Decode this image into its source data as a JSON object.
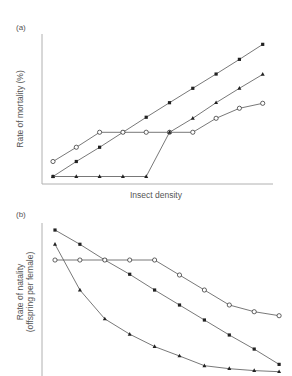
{
  "chart_data": [
    {
      "panel": "(a)",
      "type": "line",
      "title": "",
      "xlabel": "Insect density",
      "ylabel": "Rate of mortality (%)",
      "x": [
        1,
        2,
        3,
        4,
        5,
        6,
        7,
        8,
        9,
        10
      ],
      "ylim": [
        0,
        100
      ],
      "grid": false,
      "legend": null,
      "tick_labels": false,
      "series": [
        {
          "name": "filled-circle",
          "marker": "filled-circle",
          "values": [
            5,
            15,
            24.5,
            34.5,
            44.5,
            54.2,
            63.8,
            73.3,
            83.1,
            93.1
          ]
        },
        {
          "name": "open-circle",
          "marker": "open-circle",
          "values": [
            15,
            24.5,
            34.5,
            34.5,
            34.5,
            34.5,
            34.5,
            43.8,
            50.5,
            53.8
          ]
        },
        {
          "name": "filled-triangle",
          "marker": "filled-triangle",
          "values": [
            5,
            5,
            5,
            5,
            5,
            34.5,
            43.8,
            54.2,
            63.8,
            73.1
          ]
        }
      ]
    },
    {
      "panel": "(b)",
      "type": "line",
      "title": "",
      "xlabel": "",
      "ylabel": "Rate of natality (offspring per female)",
      "ylabel_lines": [
        "Rate of natality",
        "(offspring per female)"
      ],
      "x": [
        1,
        2,
        3,
        4,
        5,
        6,
        7,
        8,
        9,
        10
      ],
      "ylim": [
        0,
        100
      ],
      "grid": false,
      "legend": null,
      "tick_labels": false,
      "series": [
        {
          "name": "filled-circle",
          "marker": "filled-circle",
          "values": [
            95.4,
            86.1,
            75.8,
            66.5,
            56.2,
            46.4,
            36.6,
            26.8,
            17.6,
            7.6
          ]
        },
        {
          "name": "open-circle",
          "marker": "open-circle",
          "values": [
            75.8,
            75.8,
            75.8,
            75.8,
            75.8,
            66,
            56.2,
            46.4,
            42,
            39.4
          ]
        },
        {
          "name": "filled-triangle",
          "marker": "filled-triangle",
          "values": [
            86.1,
            56.2,
            37.3,
            27.3,
            19.2,
            13.1,
            6.7,
            4.8,
            3.5,
            2.8
          ]
        }
      ]
    }
  ],
  "labels": {
    "panel_a": "(a)",
    "panel_b": "(b)",
    "ylabel_a": "Rate of mortality (%)",
    "xlabel_a": "Insect density",
    "ylabel_b_line1": "Rate of natality",
    "ylabel_b_line2": "(offspring per female)"
  },
  "colors": {
    "line": "#555555",
    "axis": "#b0b0b0",
    "marker": "#222222",
    "text": "#555555"
  }
}
